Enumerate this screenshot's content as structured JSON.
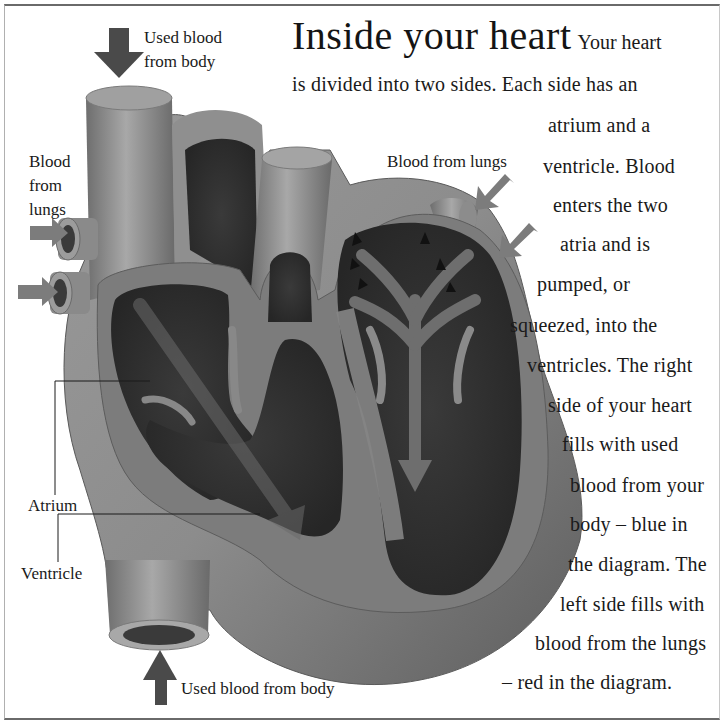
{
  "title": "Inside your heart",
  "body_lines": [
    "Your heart",
    "is divided into two sides. Each side has an",
    "atrium and a",
    "ventricle. Blood",
    "enters the two",
    "atria and is",
    "pumped, or",
    "squeezed, into the",
    "ventricles. The right",
    "side of your heart",
    "fills with used",
    "blood from your",
    "body – blue in",
    "the diagram. The",
    "left side fills with",
    "blood from the lungs",
    "– red in the diagram."
  ],
  "labels": {
    "used_blood_top_line1": "Used blood",
    "used_blood_top_line2": "from body",
    "blood_from_lungs_left_line1": "Blood",
    "blood_from_lungs_left_line2": "from",
    "blood_from_lungs_left_line3": "lungs",
    "blood_from_lungs_right": "Blood from lungs",
    "atrium": "Atrium",
    "ventricle": "Ventricle",
    "used_blood_bottom": "Used blood from body"
  },
  "colors": {
    "background": "#ffffff",
    "heart_outer": "#8a8a8a",
    "heart_wall": "#777777",
    "chamber_dark": "#2e2e2e",
    "arrow_dark": "#4a4a4a",
    "arrow_light": "#7c7c7c",
    "text": "#1a1a1a"
  }
}
